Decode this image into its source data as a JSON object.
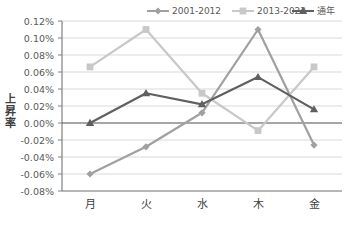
{
  "chart_data": {
    "type": "line",
    "title": "",
    "xlabel": "",
    "ylabel": "上昇率",
    "categories": [
      "月",
      "火",
      "水",
      "木",
      "金"
    ],
    "ylim": [
      -0.08,
      0.12
    ],
    "ytick_step": 0.02,
    "yticks": [
      "0.12%",
      "0.10%",
      "0.08%",
      "0.06%",
      "0.04%",
      "0.02%",
      "0.00%",
      "-0.02%",
      "-0.04%",
      "-0.06%",
      "-0.08%"
    ],
    "grid": true,
    "legend_position": "top-right",
    "series": [
      {
        "name": "2001-2012",
        "marker": "diamond",
        "color": "#a0a0a0",
        "values": [
          -0.06,
          -0.028,
          0.012,
          0.11,
          -0.026
        ]
      },
      {
        "name": "2013-2023",
        "marker": "square",
        "color": "#c8c8c8",
        "values": [
          0.066,
          0.11,
          0.035,
          -0.009,
          0.066
        ]
      },
      {
        "name": "通年",
        "marker": "triangle",
        "color": "#606060",
        "values": [
          0.0,
          0.035,
          0.022,
          0.054,
          0.016
        ]
      }
    ]
  }
}
